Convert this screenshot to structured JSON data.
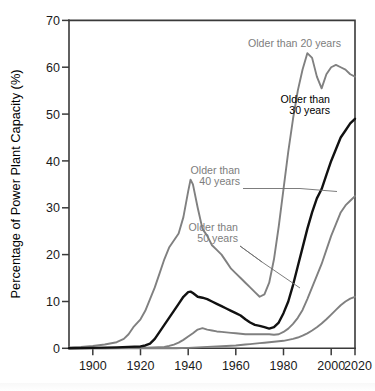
{
  "chart_data": {
    "type": "line",
    "title": "",
    "xlabel": "",
    "ylabel": "Percentage of Power Plant Capacity (%)",
    "xlim": [
      1900,
      2020
    ],
    "ylim": [
      0,
      70
    ],
    "xticks": [
      1900,
      1920,
      1940,
      1960,
      1980,
      2000,
      2020
    ],
    "yticks": [
      0,
      10,
      20,
      30,
      40,
      50,
      60,
      70
    ],
    "xtick_labels": [
      "1900",
      "1920",
      "1940",
      "1960",
      "1980",
      "2000",
      "2020"
    ],
    "ytick_labels": [
      "0",
      "10",
      "20",
      "30",
      "40",
      "50",
      "60",
      "70"
    ],
    "grid": false,
    "legend_position": "inline-annotations",
    "series": [
      {
        "name": "Older than 20 years",
        "color": "#808080",
        "label_text": "Older than 20 years",
        "x": [
          1900,
          1905,
          1910,
          1915,
          1920,
          1923,
          1925,
          1927,
          1930,
          1932,
          1934,
          1936,
          1938,
          1940,
          1942,
          1944,
          1946,
          1948,
          1950,
          1951,
          1952,
          1954,
          1956,
          1958,
          1960,
          1962,
          1964,
          1966,
          1968,
          1970,
          1972,
          1974,
          1976,
          1978,
          1980,
          1982,
          1984,
          1986,
          1988,
          1990,
          1992,
          1994,
          1996,
          1998,
          2000,
          2002,
          2004,
          2006,
          2008,
          2010,
          2012,
          2014,
          2016,
          2018,
          2020
        ],
        "values": [
          0.2,
          0.3,
          0.5,
          0.8,
          1.3,
          2.0,
          3.0,
          4.5,
          6.2,
          8.0,
          10.5,
          13.0,
          16.0,
          19.0,
          21.5,
          23.0,
          24.5,
          28.0,
          33.5,
          36.0,
          35.0,
          30.0,
          25.5,
          24.0,
          22.0,
          21.0,
          20.0,
          18.5,
          17.0,
          16.0,
          15.0,
          14.0,
          13.0,
          12.0,
          11.0,
          11.5,
          14.0,
          19.0,
          26.0,
          34.0,
          42.0,
          49.0,
          55.0,
          59.5,
          63.0,
          62.0,
          58.0,
          55.5,
          58.5,
          60.0,
          60.5,
          60.0,
          59.5,
          58.5,
          58.0
        ]
      },
      {
        "name": "Older than 30 years",
        "color": "#111111",
        "label_text": "Older than\n30 years",
        "x": [
          1900,
          1910,
          1920,
          1925,
          1930,
          1932,
          1934,
          1936,
          1938,
          1940,
          1942,
          1944,
          1946,
          1948,
          1950,
          1951,
          1952,
          1954,
          1956,
          1958,
          1960,
          1962,
          1964,
          1966,
          1968,
          1970,
          1972,
          1974,
          1976,
          1978,
          1980,
          1982,
          1984,
          1986,
          1988,
          1990,
          1992,
          1994,
          1996,
          1998,
          2000,
          2002,
          2004,
          2006,
          2008,
          2010,
          2012,
          2014,
          2016,
          2018,
          2020
        ],
        "values": [
          0.0,
          0.1,
          0.2,
          0.3,
          0.4,
          0.6,
          1.0,
          2.0,
          3.5,
          5.0,
          6.5,
          8.0,
          9.5,
          11.0,
          12.0,
          12.1,
          11.8,
          11.0,
          10.8,
          10.5,
          10.0,
          9.5,
          9.0,
          8.5,
          8.0,
          7.5,
          7.0,
          6.2,
          5.5,
          5.0,
          4.8,
          4.5,
          4.2,
          4.5,
          5.5,
          7.5,
          10.0,
          13.5,
          17.5,
          21.5,
          25.5,
          29.0,
          32.0,
          34.0,
          37.0,
          40.0,
          42.5,
          45.0,
          46.5,
          48.0,
          49.0
        ]
      },
      {
        "name": "Older than 40 years",
        "color": "#808080",
        "label_text": "Older than\n40 years",
        "x": [
          1900,
          1915,
          1930,
          1935,
          1940,
          1942,
          1944,
          1946,
          1948,
          1950,
          1952,
          1954,
          1956,
          1958,
          1960,
          1962,
          1964,
          1966,
          1968,
          1970,
          1972,
          1974,
          1976,
          1978,
          1980,
          1982,
          1984,
          1986,
          1988,
          1990,
          1992,
          1994,
          1996,
          1998,
          2000,
          2002,
          2004,
          2006,
          2008,
          2010,
          2012,
          2014,
          2016,
          2018,
          2020
        ],
        "values": [
          0.0,
          0.0,
          0.1,
          0.2,
          0.3,
          0.5,
          0.8,
          1.2,
          1.8,
          2.5,
          3.2,
          4.0,
          4.3,
          4.0,
          3.8,
          3.6,
          3.5,
          3.4,
          3.3,
          3.2,
          3.1,
          3.0,
          3.0,
          3.0,
          3.0,
          3.0,
          3.0,
          2.9,
          3.0,
          3.5,
          4.2,
          5.2,
          6.5,
          8.2,
          10.5,
          13.0,
          15.5,
          18.0,
          21.0,
          24.0,
          26.5,
          29.0,
          30.5,
          31.5,
          32.5
        ]
      },
      {
        "name": "Older than 50 years",
        "color": "#808080",
        "label_text": "Older than\n50 years",
        "x": [
          1900,
          1920,
          1940,
          1945,
          1950,
          1952,
          1954,
          1956,
          1958,
          1960,
          1962,
          1964,
          1966,
          1968,
          1970,
          1972,
          1974,
          1976,
          1978,
          1980,
          1982,
          1984,
          1986,
          1988,
          1990,
          1992,
          1994,
          1996,
          1998,
          2000,
          2002,
          2004,
          2006,
          2008,
          2010,
          2012,
          2014,
          2016,
          2018,
          2020
        ],
        "values": [
          0.0,
          0.0,
          0.0,
          0.0,
          0.1,
          0.15,
          0.2,
          0.25,
          0.3,
          0.35,
          0.4,
          0.45,
          0.5,
          0.55,
          0.6,
          0.7,
          0.8,
          0.9,
          1.0,
          1.1,
          1.2,
          1.3,
          1.4,
          1.5,
          1.6,
          1.8,
          2.0,
          2.3,
          2.7,
          3.2,
          3.8,
          4.5,
          5.3,
          6.2,
          7.2,
          8.2,
          9.2,
          10.0,
          10.6,
          11.0
        ]
      }
    ],
    "annotations": [
      {
        "name": "label-older-20",
        "text": "Older than 20 years",
        "color": "#7d7d7d"
      },
      {
        "name": "label-older-30",
        "line1": "Older than",
        "line2": "30 years",
        "color": "#000000"
      },
      {
        "name": "label-older-40",
        "line1": "Older than",
        "line2": "40 years",
        "color": "#7d7d7d"
      },
      {
        "name": "label-older-50",
        "line1": "Older than",
        "line2": "50 years",
        "color": "#7d7d7d"
      }
    ]
  }
}
